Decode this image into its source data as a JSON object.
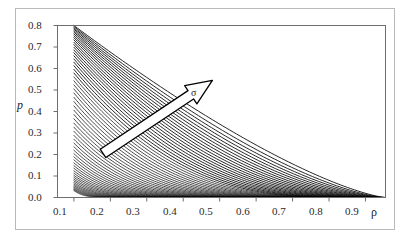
{
  "chart_data": {
    "type": "line",
    "title": "",
    "xlabel": "ρ",
    "ylabel": "p",
    "xlim": [
      0.055,
      0.955
    ],
    "ylim": [
      0.0,
      0.8
    ],
    "grid": false,
    "legend": null,
    "xticks": [
      "0.1",
      "0.2",
      "0.3",
      "0.4",
      "0.5",
      "0.6",
      "0.7",
      "0.8",
      "0.9"
    ],
    "xtick_values": [
      0.1,
      0.2,
      0.3,
      0.4,
      0.5,
      0.6,
      0.7,
      0.8,
      0.9
    ],
    "yticks": [
      "0.0",
      "0.1",
      "0.2",
      "0.3",
      "0.4",
      "0.5",
      "0.6",
      "0.7",
      "0.8"
    ],
    "ytick_values": [
      0.0,
      0.1,
      0.2,
      0.3,
      0.4,
      0.5,
      0.6,
      0.7,
      0.8
    ],
    "line_color": "#000000",
    "n_series": 60,
    "series_description": "Family of monotonically decreasing curves; each starts on the left edge near rho = 0.1 at a distinct height p between 0.03 and 0.80 and decays toward p = 0 as rho approaches 0.95.",
    "series_start_p": [
      0.8,
      0.795,
      0.789,
      0.783,
      0.776,
      0.769,
      0.761,
      0.752,
      0.743,
      0.733,
      0.722,
      0.711,
      0.699,
      0.686,
      0.673,
      0.659,
      0.644,
      0.629,
      0.613,
      0.596,
      0.579,
      0.561,
      0.543,
      0.524,
      0.505,
      0.486,
      0.466,
      0.446,
      0.426,
      0.406,
      0.386,
      0.366,
      0.346,
      0.327,
      0.308,
      0.289,
      0.271,
      0.253,
      0.236,
      0.22,
      0.204,
      0.189,
      0.175,
      0.161,
      0.148,
      0.136,
      0.124,
      0.113,
      0.103,
      0.094,
      0.085,
      0.077,
      0.069,
      0.062,
      0.056,
      0.05,
      0.045,
      0.04,
      0.036,
      0.032
    ],
    "annotations": [
      {
        "name": "sigma-arrow",
        "label": "σ",
        "meaning": "direction of increasing sigma",
        "from": {
          "rho": 0.18,
          "p": 0.205
        },
        "to": {
          "rho": 0.48,
          "p": 0.545
        },
        "fill": "#ffffff",
        "stroke": "#000000"
      }
    ]
  },
  "axes": {
    "y_label": "p",
    "x_label": "ρ",
    "y_tick_labels": [
      "0.8",
      "0.7",
      "0.6",
      "0.5",
      "0.4",
      "0.3",
      "0.2",
      "0.1",
      "0.0"
    ],
    "x_tick_labels": [
      "0.1",
      "0.2",
      "0.3",
      "0.4",
      "0.5",
      "0.6",
      "0.7",
      "0.8",
      "0.9"
    ]
  },
  "annotation": {
    "sigma_label": "σ"
  },
  "colors": {
    "frame": "#b9b9b9",
    "axis": "#6e6e6e",
    "curve": "#000000",
    "text": "#2a2a2a",
    "arrow_fill": "#ffffff",
    "arrow_stroke": "#000000"
  }
}
